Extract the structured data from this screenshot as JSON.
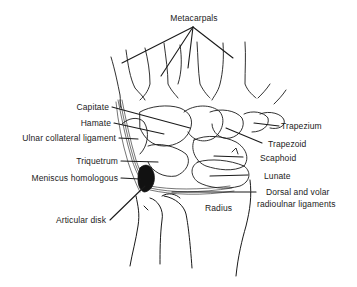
{
  "diagram": {
    "line_color": "#1a1a1a",
    "labels": {
      "metacarpals": "Metacarpals",
      "capitate": "Capitate",
      "hamate": "Hamate",
      "ulnar_collateral_ligament": "Ulnar collateral ligament",
      "triquetrum": "Triquetrum",
      "meniscus_homologous": "Meniscus homologous",
      "articular_disk": "Articular disk",
      "trapezium": "Trapezium",
      "trapezoid": "Trapezoid",
      "scaphoid": "Scaphoid",
      "lunate": "Lunate",
      "dorsal_volar_line1": "Dorsal and volar",
      "dorsal_volar_line2": "radioulnar ligaments",
      "radius": "Radius"
    }
  }
}
